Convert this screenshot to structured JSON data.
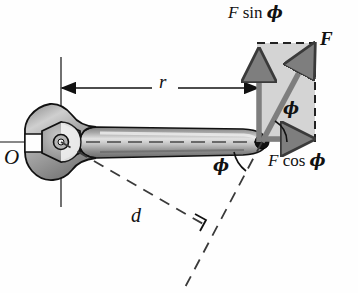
{
  "figure": {
    "type": "physics-free-body-diagram"
  },
  "labels": {
    "pivot": "O",
    "radius": "r",
    "moment_arm": "d",
    "force": "F",
    "force_sin_component": {
      "symbol": "F",
      "function": "sin",
      "angle": "ϕ"
    },
    "force_cos_component": {
      "symbol": "F",
      "function": "cos",
      "angle": "ϕ"
    },
    "angle_upper": "ϕ",
    "angle_lower": "ϕ"
  },
  "geometry": {
    "pivot_point": [
      61,
      142
    ],
    "application_point": [
      262,
      142
    ],
    "force_tip": [
      314,
      46
    ],
    "rectangle": {
      "x": 257,
      "y": 43,
      "width": 58,
      "height": 99
    },
    "r_dimension": {
      "from": [
        62,
        88
      ],
      "to": [
        258,
        88
      ]
    },
    "angle_degrees": 60
  },
  "colors": {
    "wrench_fill": "#9a9a9a",
    "wrench_highlight": "#d8d8d8",
    "wrench_shadow": "#6e6e6e",
    "outline": "#111111",
    "vector_gray": "#8a8a8a",
    "rect_fill": "#d2d2d2",
    "dashed": "#2a2a2a",
    "background": "#ffffff"
  },
  "icons": {
    "right_angle_marker": "right-angle-icon",
    "arrowhead": "arrowhead-icon"
  }
}
